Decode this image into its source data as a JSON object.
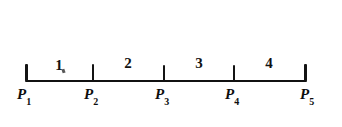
{
  "figure": {
    "title": "",
    "background_color": "#ffffff",
    "ink_color": "#111111",
    "width": 342,
    "height": 127
  },
  "axis": {
    "start_x": 25,
    "end_x": 307,
    "baseline_y": 81,
    "tick_height": 16
  },
  "points": [
    {
      "label": "P",
      "subscript": "1",
      "x": 26
    },
    {
      "label": "P",
      "subscript": "2",
      "x": 93
    },
    {
      "label": "P",
      "subscript": "3",
      "x": 164
    },
    {
      "label": "P",
      "subscript": "4",
      "x": 234
    },
    {
      "label": "P",
      "subscript": "5",
      "x": 306
    }
  ],
  "segments": [
    {
      "label": "1",
      "from": "P1",
      "to": "P2",
      "center_x": 59
    },
    {
      "label": "2",
      "from": "P2",
      "to": "P3",
      "center_x": 128
    },
    {
      "label": "3",
      "from": "P3",
      "to": "P4",
      "center_x": 199
    },
    {
      "label": "4",
      "from": "P4",
      "to": "P5",
      "center_x": 269
    }
  ],
  "artifacts": [
    {
      "name": "ink-speck",
      "x": 62,
      "y": 71
    }
  ]
}
